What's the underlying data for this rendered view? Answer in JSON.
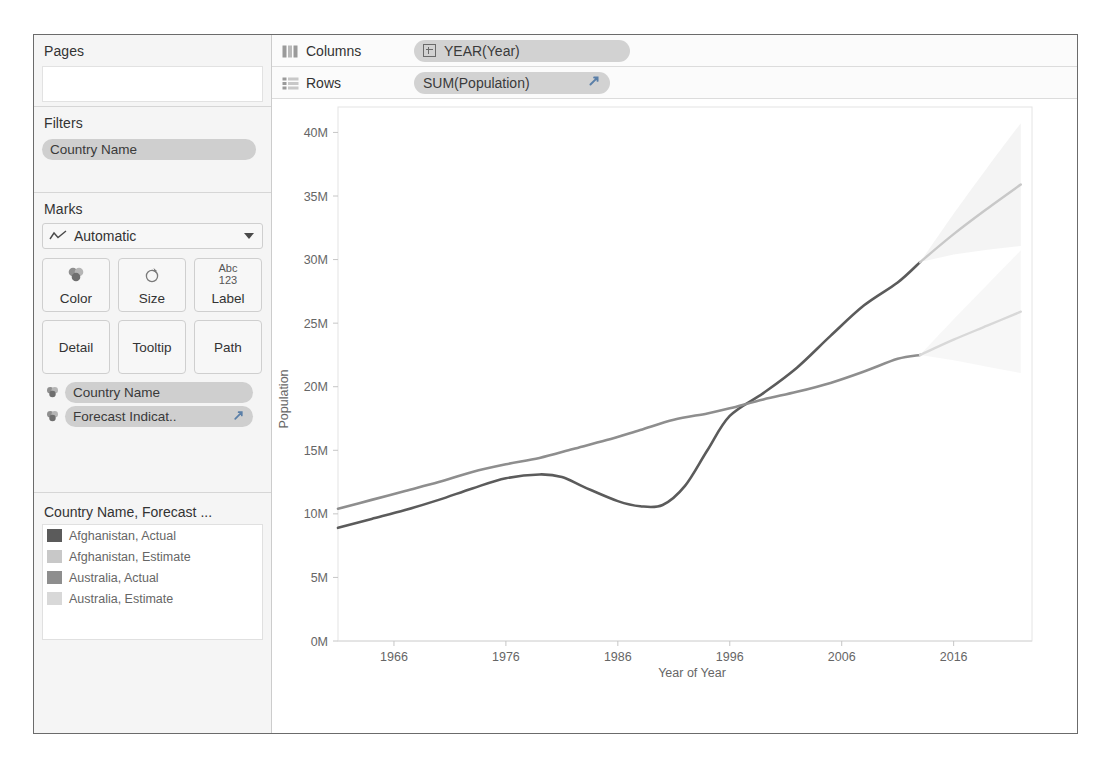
{
  "sidebar": {
    "pages": {
      "title": "Pages"
    },
    "filters": {
      "title": "Filters",
      "pills": [
        {
          "label": "Country Name"
        }
      ]
    },
    "marks": {
      "title": "Marks",
      "mark_type": "Automatic",
      "mark_type_icon": "line-chart-icon",
      "buttons": [
        {
          "label": "Color",
          "icon": "color-palette-icon",
          "glyph": ""
        },
        {
          "label": "Size",
          "icon": "size-icon",
          "glyph": ""
        },
        {
          "label": "Label",
          "icon": "label-icon",
          "glyph": "Abc\n123"
        },
        {
          "label": "Detail",
          "icon": "detail-icon",
          "glyph": ""
        },
        {
          "label": "Tooltip",
          "icon": "tooltip-icon",
          "glyph": ""
        },
        {
          "label": "Path",
          "icon": "path-icon",
          "glyph": ""
        }
      ],
      "pills": [
        {
          "label": "Country Name",
          "icon": "color-palette-icon",
          "has_forecast_arrow": false
        },
        {
          "label": "Forecast Indicat..",
          "icon": "color-palette-icon",
          "has_forecast_arrow": true
        }
      ]
    },
    "legend": {
      "title": "Country Name, Forecast ...",
      "items": [
        {
          "label": "Afghanistan, Actual",
          "color": "#5b5b5b"
        },
        {
          "label": "Afghanistan, Estimate",
          "color": "#c8c8c8"
        },
        {
          "label": "Australia, Actual",
          "color": "#8e8e8e"
        },
        {
          "label": "Australia, Estimate",
          "color": "#d8d8d8"
        }
      ]
    }
  },
  "shelves": {
    "columns": {
      "name": "Columns",
      "icon": "columns-icon",
      "pill": "YEAR(Year)"
    },
    "rows": {
      "name": "Rows",
      "icon": "rows-icon",
      "pill": "SUM(Population)",
      "has_forecast_arrow": true
    }
  },
  "chart_data": {
    "type": "line",
    "title": "",
    "xlabel": "Year of Year",
    "ylabel": "Population",
    "xlim": [
      1961,
      2023
    ],
    "ylim": [
      0,
      42000000
    ],
    "xticks": [
      1966,
      1976,
      1986,
      1996,
      2006,
      2016
    ],
    "xtick_labels": [
      "1966",
      "1976",
      "1986",
      "1996",
      "2006",
      "2016"
    ],
    "yticks": [
      0,
      5000000,
      10000000,
      15000000,
      20000000,
      25000000,
      30000000,
      35000000,
      40000000
    ],
    "ytick_labels": [
      "0M",
      "5M",
      "10M",
      "15M",
      "20M",
      "25M",
      "30M",
      "35M",
      "40M"
    ],
    "grid": false,
    "legend_position": "left-panel",
    "series": [
      {
        "name": "Afghanistan, Actual",
        "color": "#5b5b5b",
        "kind": "actual",
        "x": [
          1961,
          1964,
          1967,
          1970,
          1973,
          1976,
          1979,
          1981,
          1983,
          1986,
          1988,
          1990,
          1992,
          1994,
          1996,
          1999,
          2002,
          2005,
          2008,
          2011,
          2013
        ],
        "y": [
          8900000,
          9600000,
          10300000,
          11100000,
          12000000,
          12800000,
          13100000,
          12900000,
          12100000,
          11000000,
          10600000,
          10700000,
          12200000,
          15000000,
          17700000,
          19500000,
          21500000,
          24000000,
          26400000,
          28200000,
          29800000
        ]
      },
      {
        "name": "Afghanistan, Estimate",
        "color": "#c8c8c8",
        "kind": "estimate",
        "x": [
          2013,
          2016,
          2019,
          2022
        ],
        "y": [
          29800000,
          32000000,
          34000000,
          35900000
        ]
      },
      {
        "name": "Australia, Actual",
        "color": "#8e8e8e",
        "kind": "actual",
        "x": [
          1961,
          1964,
          1967,
          1970,
          1973,
          1976,
          1979,
          1982,
          1985,
          1988,
          1991,
          1994,
          1996,
          1999,
          2002,
          2005,
          2008,
          2011,
          2013
        ],
        "y": [
          10400000,
          11100000,
          11800000,
          12500000,
          13300000,
          13900000,
          14400000,
          15100000,
          15800000,
          16600000,
          17400000,
          17900000,
          18300000,
          19000000,
          19600000,
          20300000,
          21200000,
          22200000,
          22500000
        ]
      },
      {
        "name": "Australia, Estimate",
        "color": "#d8d8d8",
        "kind": "estimate",
        "x": [
          2013,
          2016,
          2019,
          2022
        ],
        "y": [
          22500000,
          23700000,
          24800000,
          25900000
        ]
      }
    ],
    "forecast_bands": [
      {
        "series": "Afghanistan, Estimate",
        "color": "#ebebeb"
      },
      {
        "series": "Australia, Estimate",
        "color": "#f0f0f0"
      }
    ]
  }
}
